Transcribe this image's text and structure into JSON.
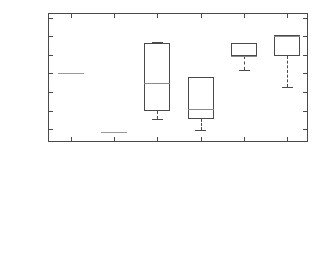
{
  "chart_data": {
    "type": "box",
    "title": "",
    "xlabel": "",
    "ylabel": "Balance [k€]",
    "ylim": [
      -149.5,
      -135.6
    ],
    "yticks": [
      -136,
      -138,
      -140,
      -142,
      -144,
      -146,
      -148
    ],
    "ytick_labels": [
      "-136",
      "-138",
      "-140",
      "-142",
      "-144",
      "-146",
      "-148"
    ],
    "grid": false,
    "legend": null,
    "categories": [
      "OCO",
      "LO",
      "NSGA-II - 1 day training data",
      "OSGA - 1 day training data",
      "NSGA-II - 30 days training data",
      "OSGA - 30 days trainign data"
    ],
    "boxes": [
      {
        "label": "OCO",
        "degenerate": true,
        "median": -142.0,
        "q1": -142.0,
        "q3": -142.0,
        "whisker_low": -142.0,
        "whisker_high": -142.0
      },
      {
        "label": "LO",
        "degenerate": true,
        "median": -148.3,
        "q1": -148.3,
        "q3": -148.3,
        "whisker_low": -148.3,
        "whisker_high": -148.3
      },
      {
        "label": "NSGA-II - 1 day training data",
        "degenerate": false,
        "median": -143.05,
        "q1": -146.1,
        "q3": -138.75,
        "whisker_low": -146.9,
        "whisker_high": -138.6
      },
      {
        "label": "OSGA - 1 day training data",
        "degenerate": false,
        "median": -145.85,
        "q1": -146.9,
        "q3": -142.35,
        "whisker_low": -148.1,
        "whisker_high": -143.0
      },
      {
        "label": "NSGA-II - 30 days training data",
        "degenerate": false,
        "median": -140.1,
        "q1": -140.1,
        "q3": -138.75,
        "whisker_low": -141.6,
        "whisker_high": -138.75
      },
      {
        "label": "OSGA - 30 days trainign data",
        "degenerate": false,
        "median": -138.0,
        "q1": -140.15,
        "q3": -137.9,
        "whisker_low": -143.5,
        "whisker_high": -137.9
      }
    ],
    "colors": {
      "axis": "#4a4a4a",
      "box_edge": "#4a4a4a",
      "median": "#8a8a8a",
      "whisker": "#4a4a4a",
      "background": "#ffffff",
      "text": "#1a1a1a"
    }
  }
}
